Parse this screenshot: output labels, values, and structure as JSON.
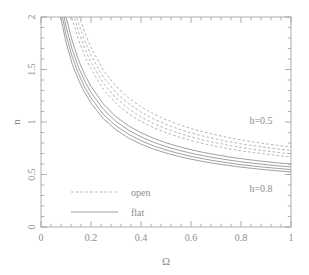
{
  "figure": {
    "title": "",
    "background_color": "#ffffff",
    "line_color_flat": "#8f8f8f",
    "line_color_open": "#a8a8a8",
    "axis_color": "#9a9a9a",
    "text_color": "#8d8d8d"
  },
  "chart_data": {
    "type": "line",
    "title": "",
    "xlabel": "Ω",
    "ylabel": "n",
    "xlim": [
      0,
      1
    ],
    "ylim": [
      0,
      2
    ],
    "xticks": [
      0,
      0.2,
      0.4,
      0.6,
      0.8,
      1
    ],
    "xticklabels": [
      "0",
      "0.2",
      "0.4",
      "0.6",
      "0.8",
      "1"
    ],
    "yticks": [
      0,
      0.5,
      1,
      1.5,
      2
    ],
    "yticklabels": [
      "0",
      "0.5",
      "1",
      "1.5",
      "2"
    ],
    "minor_tick_count_x": 4,
    "minor_tick_count_y": 4,
    "grid": false,
    "legend": {
      "position": "lower-left-inside",
      "entries": [
        {
          "label": "open",
          "style": "dashed"
        },
        {
          "label": "flat",
          "style": "solid"
        }
      ]
    },
    "annotations": [
      {
        "text": "h=0.5",
        "x": 0.88,
        "y": 0.98
      },
      {
        "text": "h=0.8",
        "x": 0.88,
        "y": 0.33
      }
    ],
    "x": [
      0.05,
      0.075,
      0.1,
      0.125,
      0.15,
      0.175,
      0.2,
      0.25,
      0.3,
      0.35,
      0.4,
      0.45,
      0.5,
      0.55,
      0.6,
      0.65,
      0.7,
      0.75,
      0.8,
      0.85,
      0.9,
      0.95,
      1.0
    ],
    "series": [
      {
        "name": "flat h=0.5",
        "style": "solid",
        "group": "flat",
        "h": 0.5,
        "values": [
          2.78,
          2.32,
          2.0,
          1.77,
          1.59,
          1.45,
          1.34,
          1.17,
          1.05,
          0.965,
          0.898,
          0.845,
          0.802,
          0.766,
          0.736,
          0.71,
          0.688,
          0.668,
          0.651,
          0.636,
          0.622,
          0.61,
          0.599
        ]
      },
      {
        "name": "flat h=0.6",
        "style": "solid",
        "group": "flat",
        "h": 0.6,
        "values": [
          2.66,
          2.22,
          1.91,
          1.69,
          1.52,
          1.39,
          1.28,
          1.12,
          1.005,
          0.922,
          0.858,
          0.807,
          0.766,
          0.732,
          0.703,
          0.678,
          0.657,
          0.638,
          0.621,
          0.607,
          0.594,
          0.582,
          0.572
        ]
      },
      {
        "name": "flat h=0.7",
        "style": "solid",
        "group": "flat",
        "h": 0.7,
        "values": [
          2.55,
          2.13,
          1.83,
          1.62,
          1.46,
          1.33,
          1.23,
          1.07,
          0.963,
          0.883,
          0.822,
          0.773,
          0.734,
          0.701,
          0.673,
          0.649,
          0.629,
          0.61,
          0.594,
          0.58,
          0.568,
          0.557,
          0.547
        ]
      },
      {
        "name": "flat h=0.8",
        "style": "solid",
        "group": "flat",
        "h": 0.8,
        "values": [
          2.45,
          2.04,
          1.76,
          1.55,
          1.4,
          1.28,
          1.18,
          1.03,
          0.925,
          0.848,
          0.789,
          0.742,
          0.705,
          0.673,
          0.646,
          0.623,
          0.603,
          0.586,
          0.57,
          0.557,
          0.545,
          0.534,
          0.525
        ]
      },
      {
        "name": "open h=0.5",
        "style": "dashed",
        "group": "open",
        "h": 0.5,
        "values": [
          3.55,
          2.96,
          2.55,
          2.26,
          2.03,
          1.85,
          1.71,
          1.49,
          1.34,
          1.23,
          1.145,
          1.078,
          1.022,
          0.976,
          0.938,
          0.905,
          0.877,
          0.851,
          0.829,
          0.81,
          0.793,
          0.777,
          0.763
        ]
      },
      {
        "name": "open h=0.6",
        "style": "dashed",
        "group": "open",
        "h": 0.6,
        "values": [
          3.39,
          2.83,
          2.44,
          2.16,
          1.94,
          1.77,
          1.635,
          1.425,
          1.28,
          1.175,
          1.094,
          1.03,
          0.977,
          0.933,
          0.896,
          0.865,
          0.838,
          0.813,
          0.792,
          0.774,
          0.757,
          0.742,
          0.729
        ]
      },
      {
        "name": "open h=0.7",
        "style": "dashed",
        "group": "open",
        "h": 0.7,
        "values": [
          3.25,
          2.71,
          2.34,
          2.07,
          1.86,
          1.7,
          1.567,
          1.366,
          1.228,
          1.126,
          1.048,
          0.986,
          0.936,
          0.894,
          0.858,
          0.828,
          0.802,
          0.778,
          0.757,
          0.74,
          0.724,
          0.71,
          0.697
        ]
      },
      {
        "name": "open h=0.8",
        "style": "dashed",
        "group": "open",
        "h": 0.8,
        "values": [
          3.12,
          2.6,
          2.24,
          1.98,
          1.78,
          1.63,
          1.503,
          1.31,
          1.178,
          1.08,
          1.005,
          0.946,
          0.898,
          0.858,
          0.823,
          0.794,
          0.769,
          0.746,
          0.726,
          0.709,
          0.694,
          0.68,
          0.668
        ]
      }
    ]
  }
}
